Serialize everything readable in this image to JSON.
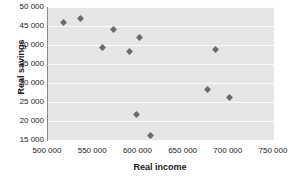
{
  "chart_data": {
    "type": "scatter",
    "title": "",
    "xlabel": "Real income",
    "ylabel": "Real savings",
    "xlim": [
      500000,
      750000
    ],
    "ylim": [
      15000,
      50000
    ],
    "xticks": [
      "500 000",
      "550 000",
      "600 000",
      "650 000",
      "700 000",
      "750 000"
    ],
    "xtick_values": [
      500000,
      550000,
      600000,
      650000,
      700000,
      750000
    ],
    "yticks": [
      "50 000",
      "45 000",
      "40 000",
      "35 000",
      "30 000",
      "25 000",
      "20 000",
      "15 000"
    ],
    "ytick_values": [
      50000,
      45000,
      40000,
      35000,
      30000,
      25000,
      20000,
      15000
    ],
    "grid": "horizontal",
    "legend": null,
    "marker": "diamond",
    "marker_color": "#6b6b6b",
    "plot_background": "#e6e6e6",
    "gridline_color": "#fbfbfb",
    "points": [
      {
        "x": 517000,
        "y": 45800
      },
      {
        "x": 536000,
        "y": 47000
      },
      {
        "x": 560000,
        "y": 39300
      },
      {
        "x": 572000,
        "y": 44000
      },
      {
        "x": 590000,
        "y": 38200
      },
      {
        "x": 601000,
        "y": 41900
      },
      {
        "x": 598000,
        "y": 21600
      },
      {
        "x": 613000,
        "y": 16300
      },
      {
        "x": 676000,
        "y": 28300
      },
      {
        "x": 685000,
        "y": 38800
      },
      {
        "x": 701000,
        "y": 26300
      }
    ]
  }
}
